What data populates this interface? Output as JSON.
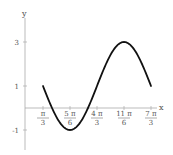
{
  "chart_data": {
    "type": "line",
    "title": "",
    "xlabel": "x",
    "ylabel": "y",
    "function": "y = 1 - 2 sin(x - pi/3)",
    "x_domain": [
      "pi/3",
      "7pi/3"
    ],
    "xlim": [
      0,
      7.6
    ],
    "ylim": [
      -2,
      3.6
    ],
    "grid": false,
    "legend": null,
    "x_ticks": [
      {
        "value": 1.0472,
        "num": "π",
        "den": "3"
      },
      {
        "value": 2.618,
        "num": "5 π",
        "den": "6"
      },
      {
        "value": 4.1888,
        "num": "4 π",
        "den": "3"
      },
      {
        "value": 5.7596,
        "num": "11 π",
        "den": "6"
      },
      {
        "value": 7.3304,
        "num": "7 π",
        "den": "3"
      }
    ],
    "y_ticks": [
      {
        "value": 3,
        "label": "3"
      },
      {
        "value": 1,
        "label": "1"
      },
      {
        "value": -1,
        "label": "-1"
      }
    ],
    "key_points": [
      {
        "x": "π/3",
        "y": 1
      },
      {
        "x": "5π/6",
        "y": -1
      },
      {
        "x": "4π/3",
        "y": 1
      },
      {
        "x": "11π/6",
        "y": 3
      },
      {
        "x": "7π/3",
        "y": 1
      }
    ],
    "colors": {
      "curve": "#111111",
      "axis": "#aaaaaa",
      "text": "#555555"
    }
  }
}
